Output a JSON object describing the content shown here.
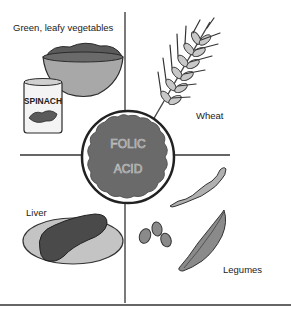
{
  "diagram": {
    "center": {
      "line1": "FOLIC",
      "line2": "ACID"
    },
    "quadrants": [
      {
        "label": "Green, leafy vegetables",
        "items": [
          "bowl of greens",
          "SPINACH can"
        ]
      },
      {
        "label": "Wheat",
        "items": [
          "wheat stalk"
        ]
      },
      {
        "label": "Liver",
        "items": [
          "liver on plate"
        ]
      },
      {
        "label": "Legumes",
        "items": [
          "bean pods",
          "beans"
        ]
      }
    ],
    "can_label": "SPINACH",
    "colors": {
      "outline": "#2a2a2a",
      "dark_fill": "#5a5a5a",
      "mid_fill": "#9a9a9a",
      "light_fill": "#c8c8c8"
    }
  }
}
